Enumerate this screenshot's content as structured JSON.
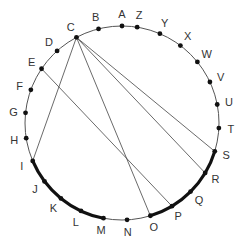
{
  "diagram": {
    "type": "circle-points",
    "points": [
      {
        "label": "A",
        "angle": 90
      },
      {
        "label": "B",
        "angle": 104
      },
      {
        "label": "C",
        "angle": 118
      },
      {
        "label": "D",
        "angle": 132
      },
      {
        "label": "E",
        "angle": 146
      },
      {
        "label": "F",
        "angle": 160
      },
      {
        "label": "G",
        "angle": 174
      },
      {
        "label": "H",
        "angle": 189
      },
      {
        "label": "I",
        "angle": 203
      },
      {
        "label": "J",
        "angle": 217
      },
      {
        "label": "K",
        "angle": 231
      },
      {
        "label": "L",
        "angle": 245
      },
      {
        "label": "M",
        "angle": 259
      },
      {
        "label": "N",
        "angle": 273
      },
      {
        "label": "O",
        "angle": 287
      },
      {
        "label": "P",
        "angle": 301
      },
      {
        "label": "Q",
        "angle": 315
      },
      {
        "label": "R",
        "angle": 329
      },
      {
        "label": "S",
        "angle": 343
      },
      {
        "label": "T",
        "angle": 357
      },
      {
        "label": "U",
        "angle": 11
      },
      {
        "label": "V",
        "angle": 25
      },
      {
        "label": "W",
        "angle": 39
      },
      {
        "label": "X",
        "angle": 53
      },
      {
        "label": "Y",
        "angle": 67
      },
      {
        "label": "Z",
        "angle": 81
      }
    ],
    "chords": [
      {
        "from": "C",
        "to": "I"
      },
      {
        "from": "C",
        "to": "O"
      },
      {
        "from": "C",
        "to": "R"
      },
      {
        "from": "C",
        "to": "S"
      },
      {
        "from": "E",
        "to": "P"
      }
    ],
    "thick_arcs": [
      {
        "from": "I",
        "to": "M"
      },
      {
        "from": "O",
        "to": "S"
      }
    ],
    "colors": {
      "line": "#444444",
      "point": "#111111",
      "label": "#333333"
    }
  }
}
